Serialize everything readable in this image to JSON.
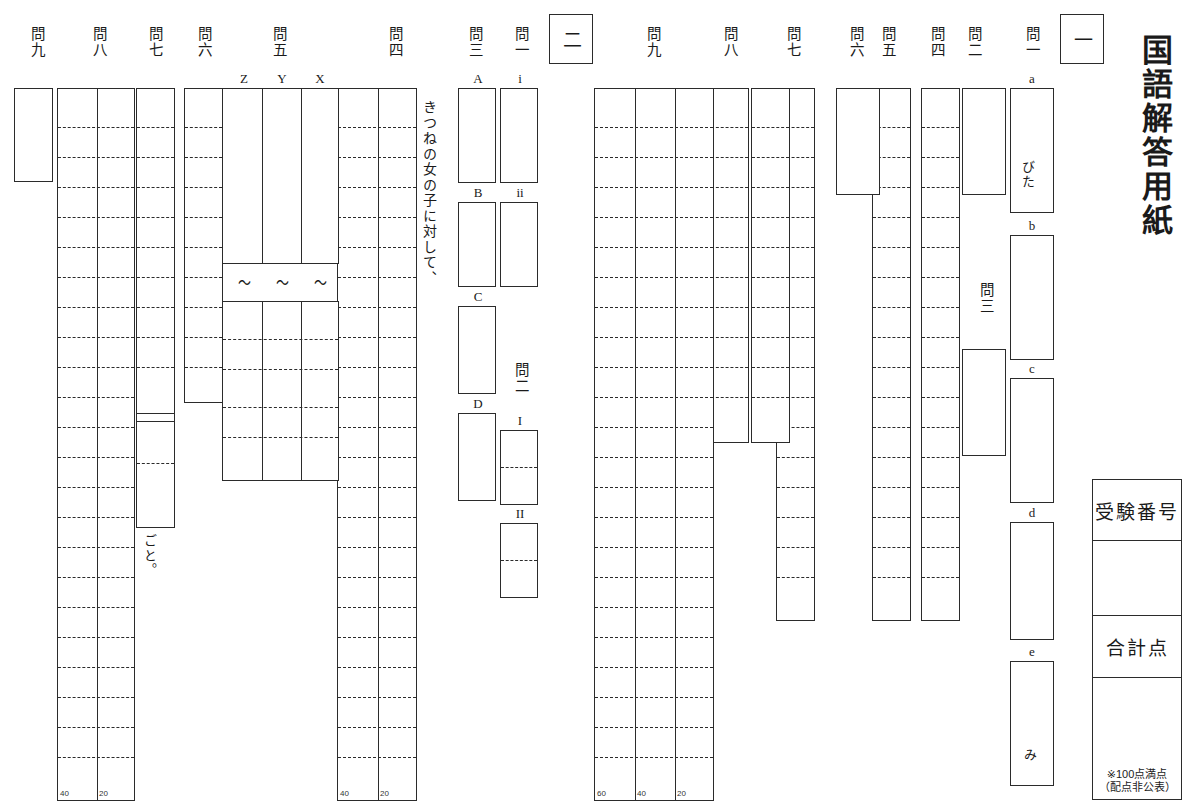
{
  "title": "国語解答用紙",
  "sections": {
    "one": {
      "marker": "一"
    },
    "two": {
      "marker": "二"
    }
  },
  "score_block": {
    "exam_number_label": "受験番号",
    "total_label": "合計点",
    "note_line1": "※100点満点",
    "note_line2": "（配点非公表）"
  },
  "section_one": {
    "q1": {
      "label": "問一",
      "items": [
        {
          "key": "a",
          "tail": "びた"
        },
        {
          "key": "b",
          "tail": ""
        },
        {
          "key": "c",
          "tail": ""
        },
        {
          "key": "d",
          "tail": ""
        },
        {
          "key": "e",
          "tail": "み"
        }
      ]
    },
    "q2": {
      "label": "問二"
    },
    "q3": {
      "label": "問三"
    },
    "q4": {
      "label": "問四"
    },
    "q5": {
      "label": "問五"
    },
    "q6": {
      "label": "問六"
    },
    "q7": {
      "label": "問七"
    },
    "q8": {
      "label": "問八"
    },
    "q9": {
      "label": "問九",
      "counts": [
        "60",
        "40",
        "20"
      ]
    }
  },
  "section_two": {
    "q1": {
      "label": "問一",
      "items": [
        "i",
        "ii"
      ]
    },
    "q2": {
      "label": "問二",
      "items": [
        "I",
        "II"
      ]
    },
    "q3": {
      "label": "問三",
      "items": [
        "A",
        "B",
        "C",
        "D"
      ]
    },
    "q4": {
      "label": "問四",
      "prompt": "きつねの女の子に対して、",
      "counts": [
        "40",
        "20"
      ]
    },
    "q5": {
      "label": "問五",
      "columns": [
        "Z",
        "Y",
        "X"
      ],
      "tilde": "〜"
    },
    "q6": {
      "label": "問六"
    },
    "q7": {
      "label": "問七",
      "tail": "ごと。"
    },
    "q8": {
      "label": "問八"
    },
    "q9": {
      "label": "問九",
      "counts": [
        "40",
        "20"
      ]
    }
  }
}
